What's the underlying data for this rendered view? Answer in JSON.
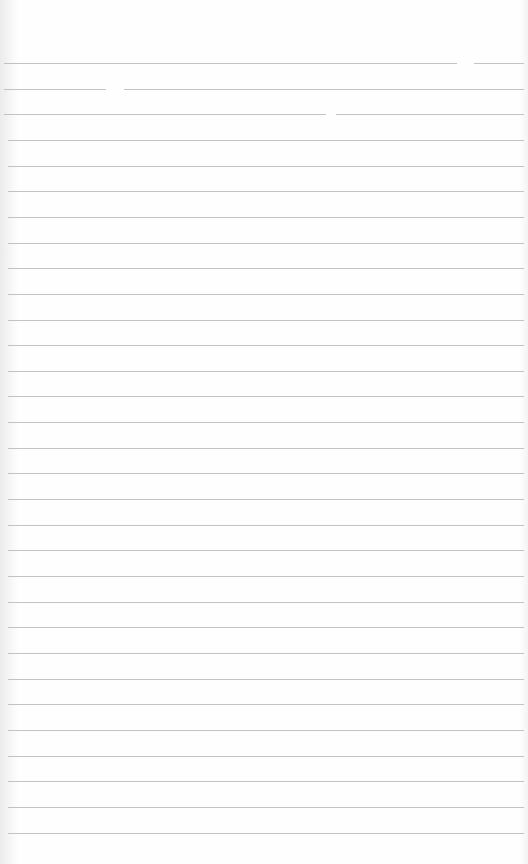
{
  "page": {
    "type": "lined-notebook-paper",
    "background_color": "#ffffff",
    "rule_color": "#b9b9b9",
    "rule_count": 31,
    "first_rule_y": 63,
    "rule_spacing": 25.65,
    "text_content": ""
  }
}
